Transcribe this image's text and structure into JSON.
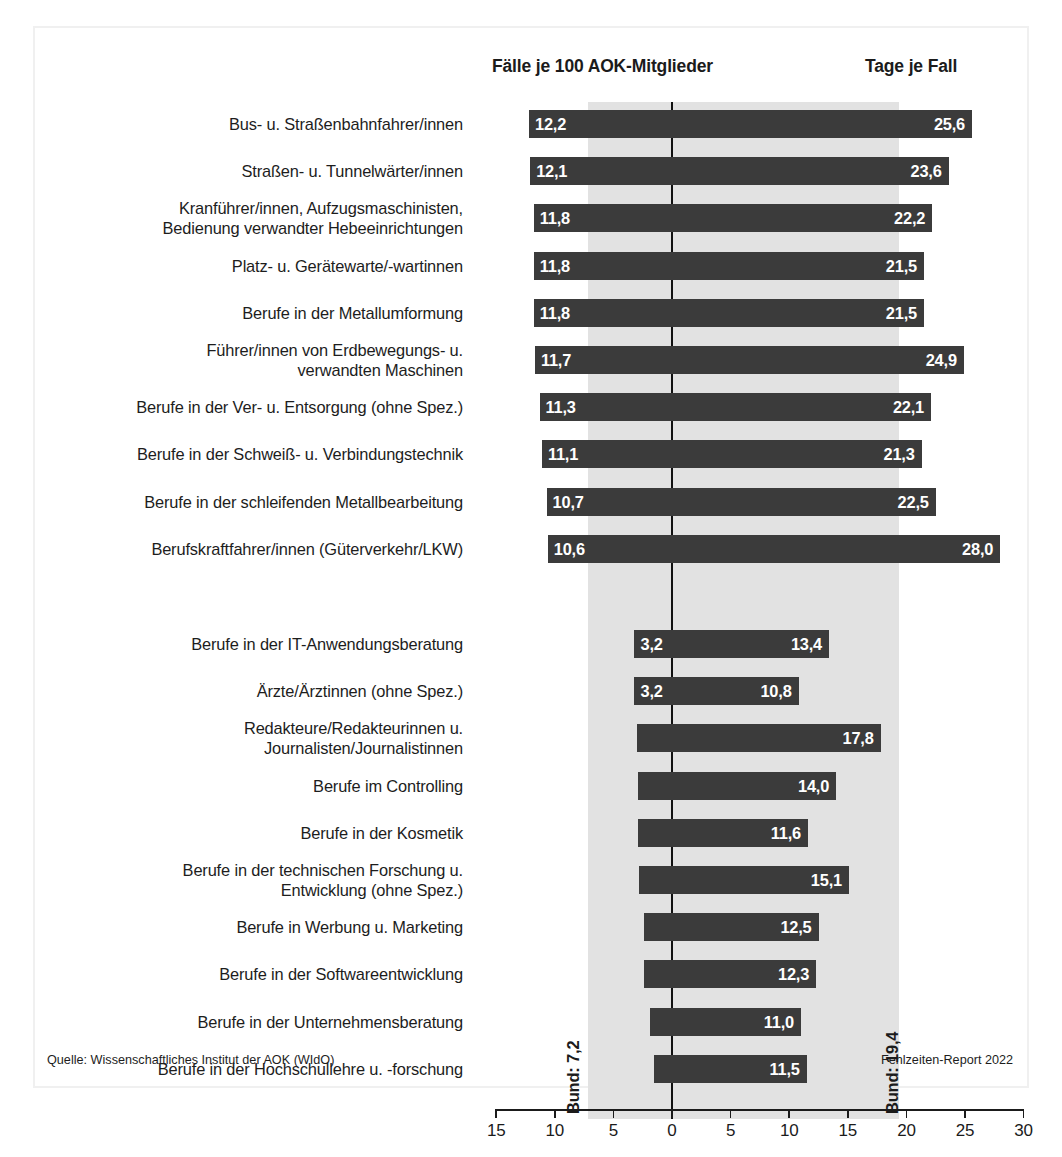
{
  "figure": {
    "header_left": "Fälle je 100 AOK-Mitglieder",
    "header_right": "Tage je Fall",
    "source_note": "Quelle: Wissenschaftliches Institut der AOK (WIdO)",
    "report_note": "Fehlzeiten-Report 2022",
    "bund_left_label": "Bund: 7,2",
    "bund_right_label": "Bund: 19,4"
  },
  "colors": {
    "bar": "#3b3b3b",
    "band": "#e2e2e2",
    "axis": "#1b1b1b",
    "background": "#ffffff",
    "value_text": "#ffffff"
  },
  "chart_data": {
    "type": "bar",
    "title": "",
    "subtitle": "",
    "orientation": "horizontal",
    "style": "bidirectional (tornado) bar chart",
    "xlabel": "",
    "ylabel": "",
    "left_axis_label": "Fälle je 100 AOK-Mitglieder",
    "right_axis_label": "Tage je Fall",
    "xlim": [
      -15,
      30
    ],
    "xticks": [
      15,
      10,
      5,
      0,
      5,
      10,
      15,
      20,
      25,
      30
    ],
    "grid": false,
    "legend": "none",
    "reference_lines": [
      {
        "name": "Bund (Fälle je 100 AOK-Mitglieder)",
        "label": "Bund: 7,2",
        "value": 7.2,
        "side": "left"
      },
      {
        "name": "Bund (Tage je Fall)",
        "label": "Bund: 19,4",
        "value": 19.4,
        "side": "right"
      }
    ],
    "series": [
      {
        "name": "Fälle je 100 AOK-Mitglieder",
        "direction": "left"
      },
      {
        "name": "Tage je Fall",
        "direction": "right"
      }
    ],
    "groups": [
      {
        "name": "Berufsgruppen mit den meisten Arbeitsunfähigkeitsfällen",
        "rows": [
          {
            "category": "Bus- u. Straßenbahnfahrer/innen",
            "cases": 12.2,
            "days": 25.6,
            "cases_label": "12,2",
            "days_label": "25,6"
          },
          {
            "category": "Straßen- u. Tunnelwärter/innen",
            "cases": 12.1,
            "days": 23.6,
            "cases_label": "12,1",
            "days_label": "23,6"
          },
          {
            "category": "Kranführer/innen, Aufzugsmaschinisten,\nBedienung verwandter Hebeeinrichtungen",
            "cases": 11.8,
            "days": 22.2,
            "cases_label": "11,8",
            "days_label": "22,2"
          },
          {
            "category": "Platz- u. Gerätewarte/-wartinnen",
            "cases": 11.8,
            "days": 21.5,
            "cases_label": "11,8",
            "days_label": "21,5"
          },
          {
            "category": "Berufe in der Metallumformung",
            "cases": 11.8,
            "days": 21.5,
            "cases_label": "11,8",
            "days_label": "21,5"
          },
          {
            "category": "Führer/innen von Erdbewegungs- u.\nverwandten Maschinen",
            "cases": 11.7,
            "days": 24.9,
            "cases_label": "11,7",
            "days_label": "24,9"
          },
          {
            "category": "Berufe in der Ver- u. Entsorgung (ohne Spez.)",
            "cases": 11.3,
            "days": 22.1,
            "cases_label": "11,3",
            "days_label": "22,1"
          },
          {
            "category": "Berufe in der Schweiß- u. Verbindungstechnik",
            "cases": 11.1,
            "days": 21.3,
            "cases_label": "11,1",
            "days_label": "21,3"
          },
          {
            "category": "Berufe in der schleifenden Metallbearbeitung",
            "cases": 10.7,
            "days": 22.5,
            "cases_label": "10,7",
            "days_label": "22,5"
          },
          {
            "category": "Berufskraftfahrer/innen (Güterverkehr/LKW)",
            "cases": 10.6,
            "days": 28.0,
            "cases_label": "10,6",
            "days_label": "28,0"
          }
        ]
      },
      {
        "name": "Berufsgruppen mit den wenigsten Arbeitsunfähigkeitsfällen",
        "rows": [
          {
            "category": "Berufe in der IT-Anwendungsberatung",
            "cases": 3.2,
            "days": 13.4,
            "cases_label": "3,2",
            "days_label": "13,4"
          },
          {
            "category": "Ärzte/Ärztinnen (ohne Spez.)",
            "cases": 3.2,
            "days": 10.8,
            "cases_label": "3,2",
            "days_label": "10,8"
          },
          {
            "category": "Redakteure/Redakteurinnen u.\nJournalisten/Journalistinnen",
            "cases": 3.0,
            "days": 17.8,
            "cases_label": "3,0",
            "days_label": "17,8"
          },
          {
            "category": "Berufe im Controlling",
            "cases": 2.9,
            "days": 14.0,
            "cases_label": "2,9",
            "days_label": "14,0"
          },
          {
            "category": "Berufe in der Kosmetik",
            "cases": 2.9,
            "days": 11.6,
            "cases_label": "2,9",
            "days_label": "11,6"
          },
          {
            "category": "Berufe in der technischen Forschung u.\nEntwicklung (ohne Spez.)",
            "cases": 2.8,
            "days": 15.1,
            "cases_label": "2,8",
            "days_label": "15,1"
          },
          {
            "category": "Berufe in Werbung u. Marketing",
            "cases": 2.4,
            "days": 12.5,
            "cases_label": "2,4",
            "days_label": "12,5"
          },
          {
            "category": "Berufe in der Softwareentwicklung",
            "cases": 2.4,
            "days": 12.3,
            "cases_label": "2,4",
            "days_label": "12,3"
          },
          {
            "category": "Berufe in der Unternehmensberatung",
            "cases": 1.9,
            "days": 11.0,
            "cases_label": "1,9",
            "days_label": "11,0"
          },
          {
            "category": "Berufe in der Hochschullehre u. -forschung",
            "cases": 1.5,
            "days": 11.5,
            "cases_label": "1,5",
            "days_label": "11,5"
          }
        ]
      }
    ]
  }
}
